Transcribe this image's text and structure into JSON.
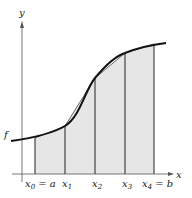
{
  "diagram": {
    "axis_labels": {
      "x": "x",
      "y": "y"
    },
    "function_label": "f",
    "partition_labels": [
      {
        "base": "x",
        "sub": "0",
        "suffix": " = a"
      },
      {
        "base": "x",
        "sub": "1",
        "suffix": ""
      },
      {
        "base": "x",
        "sub": "2",
        "suffix": ""
      },
      {
        "base": "x",
        "sub": "3",
        "suffix": ""
      },
      {
        "base": "x",
        "sub": "4",
        "suffix": " = b"
      }
    ],
    "colors": {
      "fill": "#e6e6e6",
      "curve": "#111111",
      "axis": "#555555"
    }
  }
}
